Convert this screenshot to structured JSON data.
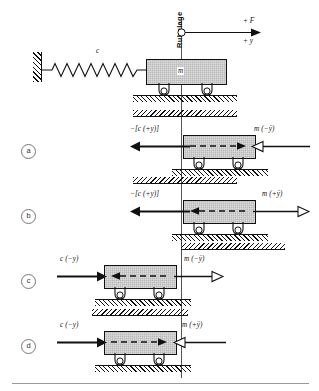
{
  "figure": {
    "title_label": "Ruhelage",
    "top_axis": {
      "force_label": "+ F",
      "coord_label": "+ y",
      "pivot_icon": "origin-circle-icon"
    },
    "spring_label": "c",
    "mass_label": "m",
    "support_icon": "roller-support-icon",
    "wall_icon": "fixed-wall-hatch-icon",
    "ground_icon": "ground-hatch-icon"
  },
  "rows": [
    {
      "tag": "a",
      "left_force_label": "−[c (+y)]",
      "left_arrow_dir": "left",
      "left_arrow_style": "solid",
      "right_force_label": "m (−ÿ)",
      "right_arrow_dir": "left",
      "right_arrow_style": "hollow",
      "inner_arrow_dir": "right",
      "block_offset": "right"
    },
    {
      "tag": "b",
      "left_force_label": "−[c (+y)]",
      "left_arrow_dir": "left",
      "left_arrow_style": "solid",
      "right_force_label": "m (+ÿ)",
      "right_arrow_dir": "right",
      "right_arrow_style": "hollow",
      "inner_arrow_dir": "left",
      "block_offset": "right"
    },
    {
      "tag": "c",
      "left_force_label": "c (−y)",
      "left_arrow_dir": "right",
      "left_arrow_style": "solid",
      "right_force_label": "m (−ÿ)",
      "right_arrow_dir": "right",
      "right_arrow_style": "hollow",
      "inner_arrow_dir": "left",
      "block_offset": "left"
    },
    {
      "tag": "d",
      "left_force_label": "c (−y)",
      "left_arrow_dir": "right",
      "left_arrow_style": "solid",
      "right_force_label": "m (+ÿ)",
      "right_arrow_dir": "left",
      "right_arrow_style": "hollow",
      "inner_arrow_dir": "right",
      "block_offset": "left"
    }
  ],
  "colors": {
    "block_fill": "#b9b9b9",
    "stroke": "#111111",
    "reference_line": "#555555",
    "rule": "#9a9a9a"
  }
}
